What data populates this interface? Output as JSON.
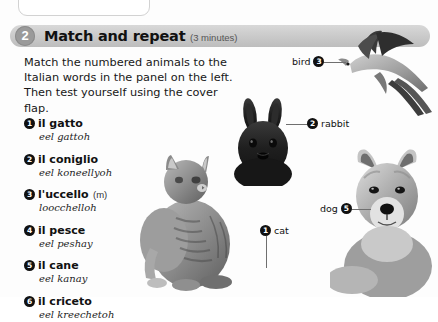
{
  "header": {
    "step_number": "2",
    "title": "Match and repeat",
    "duration": "(3 minutes)"
  },
  "instructions": {
    "text": "Match the numbered animals to the Italian words in the panel on the left. Then test yourself using the cover flap."
  },
  "vocabulary": {
    "items": [
      {
        "num": "1",
        "word": "il gatto",
        "gender": "",
        "pronunciation": "eel gattoh"
      },
      {
        "num": "2",
        "word": "il coniglio",
        "gender": "",
        "pronunciation": "eel koneellyoh"
      },
      {
        "num": "3",
        "word": "l'uccello",
        "gender": "(m)",
        "pronunciation": "loocchelloh"
      },
      {
        "num": "4",
        "word": "il pesce",
        "gender": "",
        "pronunciation": "eel peshay"
      },
      {
        "num": "5",
        "word": "il cane",
        "gender": "",
        "pronunciation": "eel kanay"
      },
      {
        "num": "6",
        "word": "il criceto",
        "gender": "",
        "pronunciation": "eel kreechetoh"
      }
    ]
  },
  "callouts": {
    "bird": {
      "label": "bird",
      "num": "3"
    },
    "rabbit": {
      "label": "rabbit",
      "num": "2"
    },
    "dog": {
      "label": "dog",
      "num": "5"
    },
    "cat": {
      "label": "cat",
      "num": "1"
    }
  },
  "photos": {
    "bird_alt": "bird-photo",
    "rabbit_alt": "rabbit-photo",
    "cat_alt": "cat-photo",
    "dog_alt": "dog-photo"
  },
  "colors": {
    "header_gray": "#c9c9c9",
    "badge_gray": "#9a9a9a",
    "marker_black": "#111111",
    "leader_line": "#6f6f6f"
  }
}
